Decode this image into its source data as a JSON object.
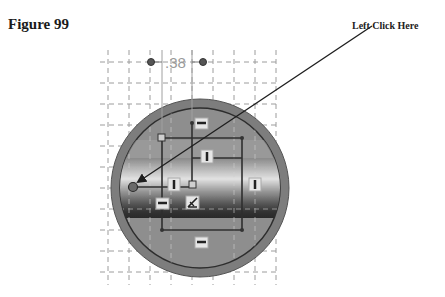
{
  "figure": {
    "title": "Figure 99",
    "callout_text": "Left Click Here"
  },
  "dimension": {
    "value": ".38"
  },
  "colors": {
    "grid": "#9c9c9c",
    "outer_ring": "#7d7d7d",
    "inner_fill": "#8e8e8e",
    "band_light": "#d8d8d8",
    "band_dark": "#3c3c3c",
    "constraint_line": "#333333",
    "arrow": "#1e1e1e"
  },
  "constraint_glyphs": [
    {
      "type": "horizontal",
      "label": "horizontal-constraint"
    },
    {
      "type": "vertical",
      "label": "vertical-constraint"
    },
    {
      "type": "vertical",
      "label": "vertical-constraint"
    },
    {
      "type": "vertical",
      "label": "vertical-constraint"
    },
    {
      "type": "horizontal",
      "label": "horizontal-constraint"
    },
    {
      "type": "perpendicular",
      "label": "perpendicular-constraint"
    },
    {
      "type": "horizontal",
      "label": "horizontal-constraint"
    }
  ]
}
